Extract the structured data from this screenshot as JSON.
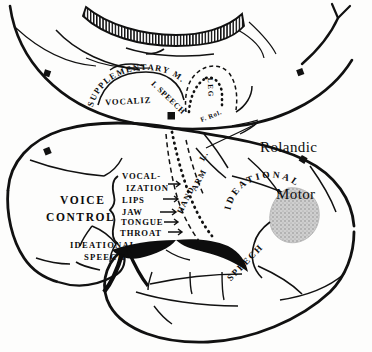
{
  "figure": {
    "background_color": "#fdfdfc",
    "ink_color": "#0b0b0b",
    "shaded_area_color": "#c7c7c7"
  },
  "callouts": {
    "rolandic_motor_line1": "Rolandic",
    "rolandic_motor_line2": "Motor"
  },
  "medial_view": {
    "supplementary_motor": "SUPPLEMENTARY M.",
    "intermediate_speech": "I. SPEECH",
    "vocalization": "VOCALIZ",
    "leg": "LEG"
  },
  "lateral_view": {
    "voice_control_line1": "VOICE",
    "voice_control_line2": "CONTROL",
    "ideational_speech_line1": "IDEATIONAL",
    "ideational_speech_line2": "SPEECH",
    "ideational": "IDEATIONAL",
    "speech": "SPEECH",
    "fissure_of_rolando": "F. Rol.",
    "somatotopy": {
      "hand": "HAND",
      "arm": "ARM",
      "leg": "L."
    },
    "voice_control_list": [
      "VOCAL-",
      "IZATION",
      "LIPS",
      "JAW",
      "TONGUE",
      "THROAT"
    ]
  }
}
